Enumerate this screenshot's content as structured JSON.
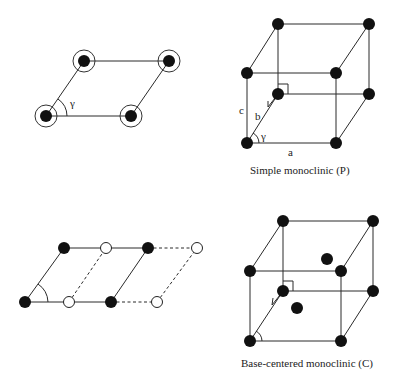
{
  "panels": {
    "lattice_2d_primitive": {
      "angle_label": "γ"
    },
    "simple_monoclinic": {
      "caption": "Simple monoclinic (P)",
      "labels": {
        "a": "a",
        "b": "b",
        "c": "c",
        "gamma": "γ"
      }
    },
    "lattice_2d_centered": {
      "legend": {
        "filled": "lattice point",
        "open": "centered point"
      }
    },
    "base_centered_monoclinic": {
      "caption": "Base-centered monoclinic (C)"
    }
  },
  "colors": {
    "atom": "#111111",
    "line": "#2a2a2a",
    "background": "#ffffff"
  }
}
